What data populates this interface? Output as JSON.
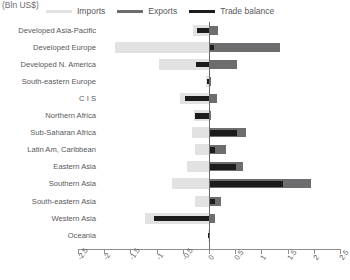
{
  "chart_data": {
    "type": "bar",
    "orientation": "horizontal",
    "title": "(Bln US$)",
    "xlabel": "",
    "ylabel": "",
    "xlim": [
      -2.5,
      2.5
    ],
    "xticks": [
      -2.5,
      -2,
      -1.5,
      -1,
      -0.5,
      0,
      0.5,
      1,
      1.5,
      2,
      2.5
    ],
    "xticklabels": [
      "-2.5",
      "-2",
      "-1.5",
      "-1",
      "-0.5",
      "0",
      "0.5",
      "1",
      "1.5",
      "2",
      "2.5"
    ],
    "grid": false,
    "legend_position": "top",
    "categories": [
      "Developed Asia-Pacific",
      "Developed Europe",
      "Developed N. America",
      "South-eastern Europe",
      "C I S",
      "Northern Africa",
      "Sub-Saharan Africa",
      "Latin Am, Caribbean",
      "Eastern Asia",
      "Southern Asia",
      "South-eastern Asia",
      "Western Asia",
      "Oceania"
    ],
    "series": [
      {
        "name": "Imports",
        "color": "#e2e2e2",
        "values": [
          -0.3,
          -1.8,
          -0.95,
          -0.05,
          -0.55,
          -0.28,
          -0.33,
          -0.27,
          -0.42,
          -0.7,
          -0.27,
          -1.22,
          -0.02
        ]
      },
      {
        "name": "Exports",
        "color": "#6d6d6f",
        "values": [
          0.18,
          1.35,
          0.53,
          0.03,
          0.15,
          0.04,
          0.7,
          0.33,
          0.64,
          1.95,
          0.23,
          0.12,
          0.02
        ]
      },
      {
        "name": "Trade balance",
        "color": "#1c1c1c",
        "values": [
          -0.22,
          0.09,
          -0.25,
          -0.03,
          -0.45,
          -0.26,
          0.53,
          0.12,
          0.52,
          1.42,
          0.12,
          -1.05,
          -0.01
        ]
      }
    ]
  },
  "legend": {
    "items": [
      {
        "label": "Imports",
        "color": "#e2e2e2"
      },
      {
        "label": "Exports",
        "color": "#6d6d6f"
      },
      {
        "label": "Trade balance",
        "color": "#1c1c1c"
      }
    ]
  }
}
